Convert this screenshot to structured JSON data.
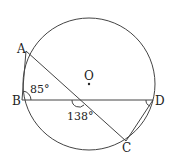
{
  "figure": {
    "type": "circle-geometry",
    "points": {
      "A": {
        "label": "A",
        "x": 26,
        "y": 51
      },
      "B": {
        "label": "B",
        "x": 22,
        "y": 100
      },
      "C": {
        "label": "C",
        "x": 126,
        "y": 141
      },
      "D": {
        "label": "D",
        "x": 153,
        "y": 100
      },
      "O": {
        "label": "O",
        "x": 89,
        "y": 84
      }
    },
    "circle": {
      "cx": 89,
      "cy": 84,
      "r": 66
    },
    "angles": {
      "ABD": {
        "label": "85°"
      },
      "BEC": {
        "label": "138°"
      }
    },
    "segments": [
      "AB",
      "AC",
      "BD",
      "CD"
    ],
    "stroke_color": "#444444"
  }
}
